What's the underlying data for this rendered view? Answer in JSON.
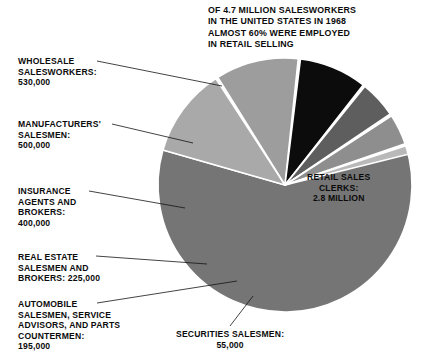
{
  "headnote": "OF 4.7 MILLION SALESWORKERS\nIN THE UNITED STATES IN 1968\nALMOST 60% WERE EMPLOYED\nIN RETAIL SELLING",
  "chart_data": {
    "type": "pie",
    "title": "OF 4.7 MILLION SALESWORKERS IN THE UNITED STATES IN 1968 ALMOST 60% WERE EMPLOYED IN RETAIL SELLING",
    "total": 4700000,
    "total_label": "4.7 MILLION",
    "unit": "salesworkers",
    "year": 1968,
    "country": "UNITED STATES",
    "legend": "none",
    "grid": false,
    "labels_inline": true,
    "categories": [
      "RETAIL SALES CLERKS",
      "WHOLESALE SALESWORKERS",
      "MANUFACTURERS' SALESMEN",
      "INSURANCE AGENTS AND BROKERS",
      "REAL ESTATE SALESMEN AND BROKERS",
      "AUTOMOBILE SALESMEN, SERVICE ADVISORS, AND PARTS COUNTERMEN",
      "SECURITIES SALESMEN"
    ],
    "values": [
      2800000,
      530000,
      500000,
      400000,
      225000,
      195000,
      55000
    ],
    "value_labels": [
      "2.8 MILLION",
      "530,000",
      "500,000",
      "400,000",
      "225,000",
      "195,000",
      "55,000"
    ],
    "colors": [
      "#757575",
      "#a9a9a9",
      "#9d9d9d",
      "#0c0c0c",
      "#5e5e5e",
      "#8e8e8e",
      "#b9b9b9"
    ],
    "slices": [
      {
        "name": "RETAIL SALES CLERKS",
        "value": 2800000,
        "value_label": "2.8 MILLION",
        "color": "#757575",
        "start_angle": -18,
        "end_angle": 196
      },
      {
        "name": "WHOLESALE SALESWORKERS",
        "value": 530000,
        "value_label": "530,000",
        "color": "#a9a9a9",
        "start_angle": 196,
        "end_angle": 237
      },
      {
        "name": "MANUFACTURERS' SALESMEN",
        "value": 500000,
        "value_label": "500,000",
        "color": "#9d9d9d",
        "start_angle": 238,
        "end_angle": 276
      },
      {
        "name": "INSURANCE AGENTS AND BROKERS",
        "value": 400000,
        "value_label": "400,000",
        "color": "#0c0c0c",
        "start_angle": 277,
        "end_angle": 308
      },
      {
        "name": "REAL ESTATE SALESMEN AND BROKERS",
        "value": 225000,
        "value_label": "225,000",
        "color": "#5e5e5e",
        "start_angle": 309,
        "end_angle": 326
      },
      {
        "name": "AUTOMOBILE SALESMEN, SERVICE ADVISORS, AND PARTS COUNTERMEN",
        "value": 195000,
        "value_label": "195,000",
        "color": "#8e8e8e",
        "start_angle": 327,
        "end_angle": 341
      },
      {
        "name": "SECURITIES SALESMEN",
        "value": 55000,
        "value_label": "55,000",
        "color": "#b9b9b9",
        "start_angle": 342,
        "end_angle": 346
      }
    ],
    "geometry": {
      "cx": 285,
      "cy": 185,
      "r": 127,
      "separator_color": "#ffffff",
      "separator_width": 1.6
    }
  },
  "labels": {
    "retail": "RETAIL SALES\nCLERKS:\n2.8 MILLION",
    "wholesale": "WHOLESALE\nSALESWORKERS:\n530,000",
    "manufacturers": "MANUFACTURERS'\nSALESMEN:\n500,000",
    "insurance": "INSURANCE\nAGENTS AND\nBROKERS:\n400,000",
    "realestate": "REAL ESTATE\nSALESMEN AND\nBROKERS: 225,000",
    "automobile": "AUTOMOBILE\nSALESMEN, SERVICE\nADVISORS, AND PARTS\nCOUNTERMEN:\n195,000",
    "securities": "SECURITIES SALESMEN:\n55,000"
  },
  "leader_lines": [
    {
      "name": "wholesale-leader",
      "x1": 97,
      "y1": 61,
      "x2": 222,
      "y2": 86
    },
    {
      "name": "manufacturers-leader",
      "x1": 112,
      "y1": 124,
      "x2": 193,
      "y2": 143
    },
    {
      "name": "insurance-leader",
      "x1": 89,
      "y1": 191,
      "x2": 185,
      "y2": 208
    },
    {
      "name": "realestate-leader",
      "x1": 96,
      "y1": 256,
      "x2": 207,
      "y2": 264
    },
    {
      "name": "automobile-leader",
      "x1": 97,
      "y1": 303,
      "x2": 237,
      "y2": 281
    },
    {
      "name": "securities-leader",
      "x1": 230,
      "y1": 326,
      "x2": 253,
      "y2": 296
    }
  ]
}
